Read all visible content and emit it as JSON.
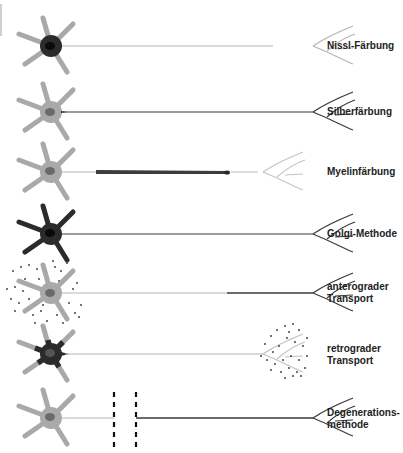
{
  "figure": {
    "colors": {
      "light": "#a9a9a9",
      "mid": "#8a8a8a",
      "dark": "#2b2b2b",
      "black": "#111111",
      "stripe": "#cfcfcf"
    },
    "rows": [
      {
        "id": "nissl",
        "label_lines": [
          "Nissl-Färbung"
        ],
        "y": 46
      },
      {
        "id": "silber",
        "label_lines": [
          "Silberfärbung"
        ],
        "y": 112
      },
      {
        "id": "myelin",
        "label_lines": [
          "Myelinfärbung"
        ],
        "y": 172
      },
      {
        "id": "golgi",
        "label_lines": [
          "Golgi-Methode"
        ],
        "y": 234
      },
      {
        "id": "antero",
        "label_lines": [
          "anterograder",
          "Transport"
        ],
        "y": 293
      },
      {
        "id": "retro",
        "label_lines": [
          "retrograder",
          "Transport"
        ],
        "y": 354
      },
      {
        "id": "degen",
        "label_lines": [
          "Degenerations-",
          "methode"
        ],
        "y": 418
      }
    ]
  }
}
